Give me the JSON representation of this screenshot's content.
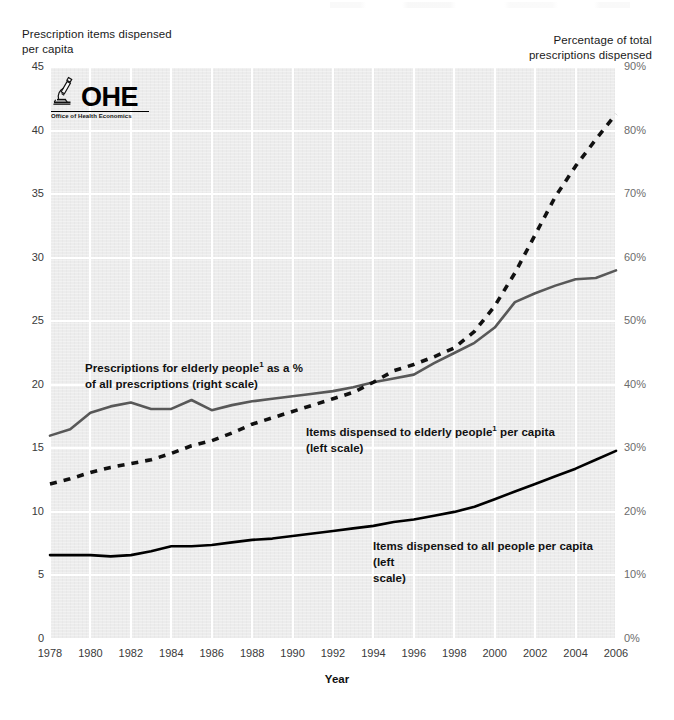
{
  "figure": {
    "left_axis_title": "Prescription items dispensed\nper capita",
    "right_axis_title": "Percentage of total\nprescriptions dispensed",
    "x_axis_title": "Year",
    "logo": {
      "mark": "microscope-icon",
      "text": "OHE",
      "subtitle": "Office of Health Economics"
    },
    "annotations": [
      {
        "id": "elderly-pct",
        "line1": "Prescriptions for elderly people",
        "sup1": "1",
        "line1b": " as a %",
        "line2": "of all prescriptions (right scale)"
      },
      {
        "id": "elderly-items",
        "line1": "Items dispensed to elderly people",
        "sup1": "1",
        "line1b": " per capita",
        "line2": "(left scale)"
      },
      {
        "id": "all-items",
        "line1": "Items dispensed to all people per capita (left",
        "line2": "scale)"
      }
    ],
    "colors": {
      "plot_background": "#ececec",
      "gridline": "#ffffff",
      "series_elderly_pct": "#585858",
      "series_elderly_items": "#111111",
      "series_all_items": "#000000",
      "left_tick_text": "#3a3a3a",
      "right_tick_text": "#6c6c6c"
    }
  },
  "chart_data": {
    "type": "line",
    "title": "",
    "subtitle": "",
    "xlabel": "Year",
    "ylabel": "Prescription items dispensed per capita",
    "y2label": "Percentage of total prescriptions dispensed",
    "grid": true,
    "legend_position": "inline-annotations",
    "xlim": [
      1978,
      2006
    ],
    "ylim": [
      0,
      45
    ],
    "y2lim": [
      0,
      90
    ],
    "xticks": [
      1978,
      1980,
      1982,
      1984,
      1986,
      1988,
      1990,
      1992,
      1994,
      1996,
      1998,
      2000,
      2002,
      2004,
      2006
    ],
    "yticks": [
      0,
      5,
      10,
      15,
      20,
      25,
      30,
      35,
      40,
      45
    ],
    "y2ticks": [
      "0%",
      "10%",
      "20%",
      "30%",
      "40%",
      "50%",
      "60%",
      "70%",
      "80%",
      "90%"
    ],
    "x": [
      1978,
      1979,
      1980,
      1981,
      1982,
      1983,
      1984,
      1985,
      1986,
      1987,
      1988,
      1989,
      1990,
      1991,
      1992,
      1993,
      1994,
      1995,
      1996,
      1997,
      1998,
      1999,
      2000,
      2001,
      2002,
      2003,
      2004,
      2005,
      2006
    ],
    "series": [
      {
        "name": "Prescriptions for elderly people as a % of all prescriptions (right scale)",
        "axis": "right",
        "style": "solid",
        "color": "#585858",
        "unit": "%",
        "values": [
          32.0,
          33.0,
          35.6,
          36.6,
          37.2,
          36.2,
          36.2,
          37.6,
          36.0,
          36.8,
          37.4,
          37.8,
          38.2,
          38.6,
          39.0,
          39.6,
          40.4,
          41.0,
          41.6,
          43.4,
          45.0,
          46.6,
          49.0,
          53.0,
          54.4,
          55.6,
          56.6,
          56.8,
          58.0
        ]
      },
      {
        "name": "Items dispensed to elderly people per capita (left scale)",
        "axis": "left",
        "style": "dashed",
        "color": "#111111",
        "unit": "items",
        "values": [
          12.2,
          12.6,
          13.1,
          13.5,
          13.8,
          14.1,
          14.6,
          15.2,
          15.6,
          16.2,
          16.9,
          17.4,
          17.9,
          18.4,
          18.9,
          19.4,
          20.2,
          21.1,
          21.6,
          22.2,
          22.9,
          24.2,
          26.2,
          28.8,
          31.8,
          34.8,
          37.2,
          39.3,
          41.3
        ]
      },
      {
        "name": "Items dispensed to all people per capita (left scale)",
        "axis": "left",
        "style": "solid",
        "color": "#000000",
        "unit": "items",
        "values": [
          6.6,
          6.6,
          6.6,
          6.5,
          6.6,
          6.9,
          7.3,
          7.3,
          7.4,
          7.6,
          7.8,
          7.9,
          8.1,
          8.3,
          8.5,
          8.7,
          8.9,
          9.2,
          9.4,
          9.7,
          10.0,
          10.4,
          11.0,
          11.6,
          12.2,
          12.8,
          13.4,
          14.1,
          14.8
        ]
      }
    ],
    "footnote_marker": "1"
  }
}
